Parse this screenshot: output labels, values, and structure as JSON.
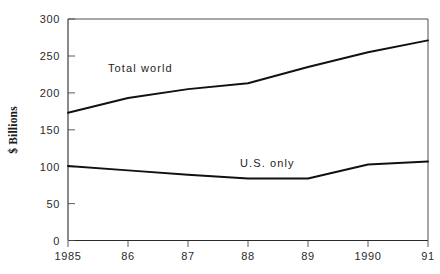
{
  "chart_data": {
    "type": "line",
    "title": "",
    "xlabel": "",
    "ylabel": "$ Billions",
    "x": [
      1985,
      1986,
      1987,
      1988,
      1989,
      1990,
      1991
    ],
    "categories": [
      "1985",
      "86",
      "87",
      "88",
      "89",
      "1990",
      "91"
    ],
    "ylim": [
      0,
      300
    ],
    "yticks": [
      0,
      50,
      100,
      150,
      200,
      250,
      300
    ],
    "ytick_labels": [
      "0",
      "50",
      "100",
      "150",
      "200",
      "250",
      "300"
    ],
    "grid": false,
    "legend_position": "inline-annotation",
    "series": [
      {
        "name": "Total world",
        "values": [
          173,
          193,
          205,
          213,
          235,
          255,
          271
        ],
        "color": "#111111",
        "label_x": 1986.0,
        "label_y": 228
      },
      {
        "name": "U.S. only",
        "values": [
          101,
          95,
          89,
          84,
          84,
          103,
          107
        ],
        "color": "#111111",
        "label_x": 1988.3,
        "label_y": 113
      }
    ],
    "annotations": [
      {
        "text": "Total world",
        "series": "Total world"
      },
      {
        "text": "U.S. only",
        "series": "U.S. only"
      }
    ]
  },
  "axis": {
    "y_title": "$ Billions",
    "y_tick_0": "0",
    "y_tick_1": "50",
    "y_tick_2": "100",
    "y_tick_3": "150",
    "y_tick_4": "200",
    "y_tick_5": "250",
    "y_tick_6": "300",
    "x_tick_0": "1985",
    "x_tick_1": "86",
    "x_tick_2": "87",
    "x_tick_3": "88",
    "x_tick_4": "89",
    "x_tick_5": "1990",
    "x_tick_6": "91"
  },
  "labels": {
    "total_world": "Total world",
    "us_only": "U.S. only"
  }
}
